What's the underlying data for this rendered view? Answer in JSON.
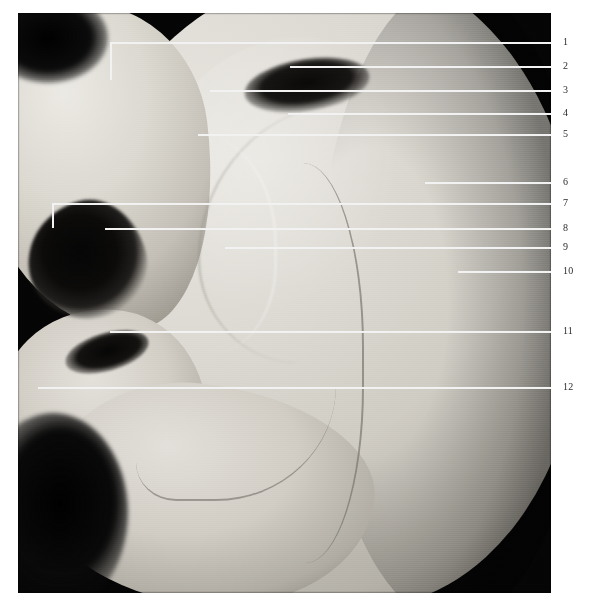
{
  "figure": {
    "kind": "anatomical-photograph",
    "background_color": "#ffffff",
    "plate_color": "#050505",
    "leader_color": "#f2f2f2",
    "number_color": "#2b2b2b"
  },
  "labels": [
    {
      "number": "1",
      "y": 42,
      "line_start_x": 110,
      "bracket_drop_to_y": 80
    },
    {
      "number": "2",
      "y": 66,
      "line_start_x": 290,
      "bracket_drop_to_y": null
    },
    {
      "number": "3",
      "y": 90,
      "line_start_x": 210,
      "bracket_drop_to_y": null
    },
    {
      "number": "4",
      "y": 113,
      "line_start_x": 288,
      "bracket_drop_to_y": null
    },
    {
      "number": "5",
      "y": 134,
      "line_start_x": 198,
      "bracket_drop_to_y": null
    },
    {
      "number": "6",
      "y": 182,
      "line_start_x": 425,
      "bracket_drop_to_y": null
    },
    {
      "number": "7",
      "y": 203,
      "line_start_x": 52,
      "bracket_drop_to_y": 228
    },
    {
      "number": "8",
      "y": 228,
      "line_start_x": 105,
      "bracket_drop_to_y": null
    },
    {
      "number": "9",
      "y": 247,
      "line_start_x": 225,
      "bracket_drop_to_y": null
    },
    {
      "number": "10",
      "y": 271,
      "line_start_x": 458,
      "bracket_drop_to_y": null
    },
    {
      "number": "11",
      "y": 331,
      "line_start_x": 110,
      "bracket_drop_to_y": null
    },
    {
      "number": "12",
      "y": 387,
      "line_start_x": 38,
      "bracket_drop_to_y": null
    }
  ]
}
